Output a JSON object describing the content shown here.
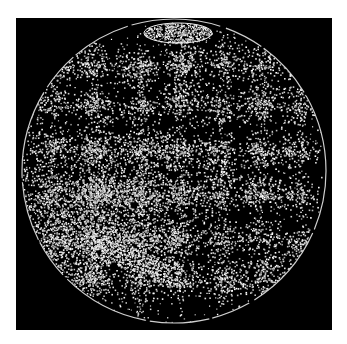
{
  "image": {
    "description": "Telescopic drawing of a planetary disc (Mars-like) on black background",
    "background_color": "#000000",
    "page_color": "#ffffff",
    "speckle_color": "#d8d8d8",
    "disc": {
      "cx": 174,
      "cy": 171,
      "r": 152
    },
    "polar_cap": {
      "cx": 178,
      "cy": 33,
      "rx": 34,
      "ry": 10
    },
    "bright_region": {
      "cx": 95,
      "cy": 215,
      "rx": 80,
      "ry": 60
    },
    "blob_grid": {
      "cols": [
        52,
        95,
        140,
        180,
        222,
        262,
        300
      ],
      "rows": [
        65,
        105,
        150,
        195,
        240,
        280
      ]
    }
  }
}
